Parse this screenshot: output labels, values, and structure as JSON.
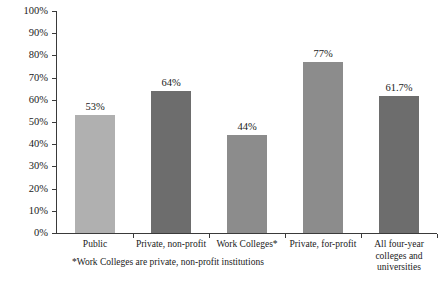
{
  "chart_data": {
    "type": "bar",
    "title": "",
    "xlabel": "",
    "ylabel": "",
    "ylim": [
      0,
      100
    ],
    "grid": false,
    "legend": "none",
    "categories": [
      "Public",
      "Private, non-profit",
      "Work Colleges*",
      "Private, for-profit",
      "All four-year\ncolleges and\nuniversities"
    ],
    "values": [
      53,
      64,
      44,
      77,
      61.7
    ],
    "value_labels": [
      "53%",
      "64%",
      "44%",
      "77%",
      "61.7%"
    ],
    "bar_colors": [
      "#b0b0b0",
      "#6d6d6d",
      "#8c8c8c",
      "#8c8c8c",
      "#6d6d6d"
    ],
    "ytick_labels": [
      "0%",
      "10%",
      "20%",
      "30%",
      "40%",
      "50%",
      "60%",
      "70%",
      "80%",
      "90%",
      "100%"
    ],
    "ytick_values": [
      0,
      10,
      20,
      30,
      40,
      50,
      60,
      70,
      80,
      90,
      100
    ],
    "footnote": "*Work Colleges are private, non-profit institutions",
    "axis_color": "#3a3a3a"
  }
}
